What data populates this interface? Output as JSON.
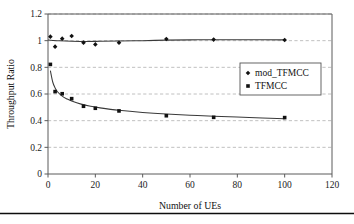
{
  "figure": {
    "background": "#ffffff",
    "footer_rule_color": "#0d0d0d"
  },
  "chart_data": {
    "type": "scatter",
    "title": "",
    "xlabel": "Number of UEs",
    "ylabel": "Throughput Ratio",
    "xlim": [
      0,
      120
    ],
    "ylim": [
      0,
      1.2
    ],
    "xticks": [
      "0",
      "20",
      "40",
      "60",
      "80",
      "100",
      "120"
    ],
    "xtick_values": [
      0,
      20,
      40,
      60,
      80,
      100,
      120
    ],
    "yticks": [
      "0",
      "0.2",
      "0.4",
      "0.6",
      "0.8",
      "1",
      "1.2"
    ],
    "ytick_values": [
      0,
      0.2,
      0.4,
      0.6,
      0.8,
      1.0,
      1.2
    ],
    "grid": "horizontal-dashed",
    "legend_position": "center-right",
    "marker_color": "#111111",
    "line_color": "#3a3a3a",
    "grid_color": "#b9b9b9",
    "series": [
      {
        "name": "mod_TFMCC",
        "marker": "diamond",
        "x": [
          1,
          3,
          6,
          10,
          15,
          20,
          30,
          50,
          70,
          100
        ],
        "values": [
          1.03,
          0.955,
          1.015,
          1.035,
          0.985,
          0.972,
          0.985,
          1.012,
          1.008,
          1.005
        ],
        "fit_x": [
          0,
          2,
          5,
          10,
          16,
          22,
          30,
          40,
          50,
          60,
          70,
          85,
          100
        ],
        "fit_y": [
          1.005,
          1.002,
          0.999,
          0.996,
          0.994,
          0.995,
          0.997,
          1.0,
          1.004,
          1.006,
          1.007,
          1.007,
          1.006
        ]
      },
      {
        "name": "TFMCC",
        "marker": "square",
        "x": [
          1,
          3,
          6,
          10,
          15,
          20,
          30,
          50,
          70,
          100
        ],
        "values": [
          0.822,
          0.618,
          0.602,
          0.565,
          0.508,
          0.493,
          0.473,
          0.437,
          0.425,
          0.423
        ],
        "fit_x": [
          1,
          2,
          3,
          4,
          6,
          8,
          10,
          14,
          18,
          22,
          30,
          40,
          50,
          60,
          70,
          85,
          100
        ],
        "fit_y": [
          0.775,
          0.69,
          0.645,
          0.617,
          0.584,
          0.563,
          0.547,
          0.524,
          0.508,
          0.496,
          0.478,
          0.462,
          0.45,
          0.441,
          0.433,
          0.424,
          0.414
        ]
      }
    ]
  },
  "legend": {
    "entries": [
      {
        "label": "mod_TFMCC",
        "marker": "diamond"
      },
      {
        "label": "TFMCC",
        "marker": "square"
      }
    ]
  }
}
